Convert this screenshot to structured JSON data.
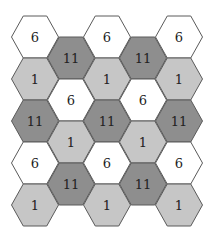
{
  "diagram": {
    "type": "hexagonal-grid",
    "colors": {
      "6": "#ffffff",
      "1": "#c6c6c6",
      "11": "#8e8e8e",
      "stroke": "#5a5a5a"
    },
    "columns": [
      {
        "x": 35,
        "cells": [
          {
            "y": 37,
            "label": "6"
          },
          {
            "y": 79,
            "label": "1"
          },
          {
            "y": 121,
            "label": "11"
          },
          {
            "y": 163,
            "label": "6"
          },
          {
            "y": 205,
            "label": "1"
          }
        ]
      },
      {
        "x": 71,
        "cells": [
          {
            "y": 58,
            "label": "11"
          },
          {
            "y": 100,
            "label": "6"
          },
          {
            "y": 142,
            "label": "1"
          },
          {
            "y": 184,
            "label": "11"
          }
        ]
      },
      {
        "x": 107,
        "cells": [
          {
            "y": 37,
            "label": "6"
          },
          {
            "y": 79,
            "label": "1"
          },
          {
            "y": 121,
            "label": "11"
          },
          {
            "y": 163,
            "label": "6"
          },
          {
            "y": 205,
            "label": "1"
          }
        ]
      },
      {
        "x": 143,
        "cells": [
          {
            "y": 58,
            "label": "11"
          },
          {
            "y": 100,
            "label": "6"
          },
          {
            "y": 142,
            "label": "1"
          },
          {
            "y": 184,
            "label": "11"
          }
        ]
      },
      {
        "x": 179,
        "cells": [
          {
            "y": 37,
            "label": "6"
          },
          {
            "y": 79,
            "label": "1"
          },
          {
            "y": 121,
            "label": "11"
          },
          {
            "y": 163,
            "label": "6"
          },
          {
            "y": 205,
            "label": "1"
          }
        ]
      }
    ]
  }
}
